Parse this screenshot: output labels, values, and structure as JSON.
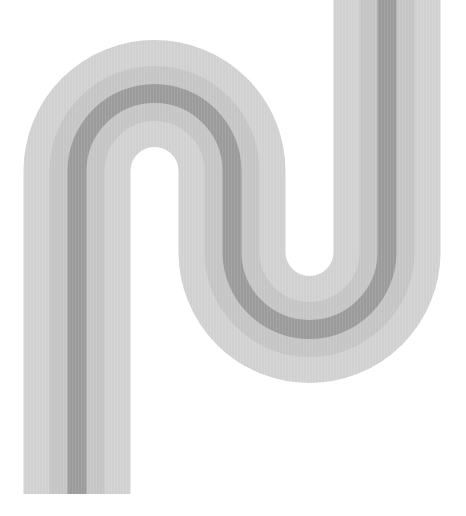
{
  "artwork": {
    "description": "abstract serpentine striped band",
    "background": "#ffffff",
    "bands": [
      {
        "name": "outer-band",
        "color": "#d1d1d1",
        "width": 107
      },
      {
        "name": "middle-band",
        "color": "#c5c5c5",
        "width": 55
      },
      {
        "name": "center-stripe",
        "color": "#9b9b9b",
        "width": 19
      }
    ],
    "path": "M 77 494 L 77 171 A 77.5 77.5 0 0 1 232 171 L 232 252 A 77.5 77.5 0 0 0 387 252 L 387 -2"
  }
}
